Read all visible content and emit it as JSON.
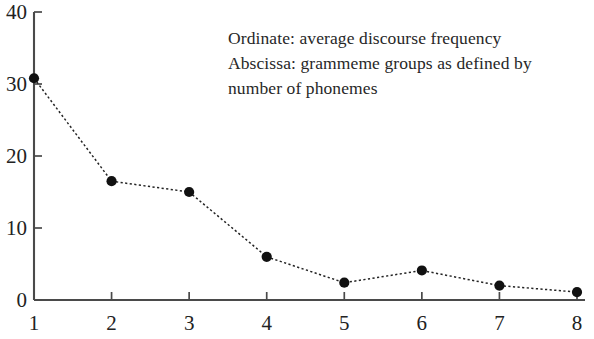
{
  "chart_data": {
    "type": "line",
    "title": "",
    "subtitle": "",
    "xlabel": "grammeme groups as defined by number of phonemes",
    "ylabel": "average discourse frequency",
    "categories": [
      "1",
      "2",
      "3",
      "4",
      "5",
      "6",
      "7",
      "8"
    ],
    "x": [
      1,
      2,
      3,
      4,
      5,
      6,
      7,
      8
    ],
    "values": [
      30.8,
      16.5,
      15.0,
      6.0,
      2.4,
      4.1,
      2.0,
      1.1
    ],
    "series": [
      {
        "name": "average discourse frequency",
        "values": [
          30.8,
          16.5,
          15.0,
          6.0,
          2.4,
          4.1,
          2.0,
          1.1
        ]
      }
    ],
    "xlim": [
      1,
      8
    ],
    "ylim": [
      0,
      40
    ],
    "y_ticks": [
      0,
      10,
      20,
      30,
      40
    ],
    "x_ticks": [
      1,
      2,
      3,
      4,
      5,
      6,
      7,
      8
    ],
    "y_tick_labels": [
      "0",
      "10",
      "20",
      "30",
      "40"
    ],
    "x_tick_labels": [
      "1",
      "2",
      "3",
      "4",
      "5",
      "6",
      "7",
      "8"
    ],
    "grid": false,
    "legend": null,
    "legend_position": "none",
    "line_style": "dotted",
    "marker": "filled-circle",
    "line_color": "#242424",
    "marker_color": "#111111",
    "axis_color": "#4a4a4a",
    "background_color": "#ffffff",
    "annotations": [
      "Ordinate: average discourse frequency",
      "Abscissa: grammeme groups as defined by",
      "number of phonemes"
    ]
  },
  "annotation": {
    "line1": "Ordinate: average discourse frequency",
    "line2": "Abscissa: grammeme groups as defined by",
    "line3": "number of phonemes"
  }
}
